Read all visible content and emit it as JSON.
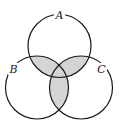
{
  "diagram": {
    "type": "venn",
    "sets": [
      {
        "label": "A",
        "cx": 59.5,
        "cy": 46,
        "r": 31.5
      },
      {
        "label": "B",
        "cx": 37,
        "cy": 87.5,
        "r": 31.5
      },
      {
        "label": "C",
        "cx": 81,
        "cy": 87.5,
        "r": 31.5
      }
    ],
    "shaded_regions": [
      "A∩B",
      "A∩C",
      "B∩C"
    ],
    "colors": {
      "stroke": "#1a1a1a",
      "shade": "#d4d4d4",
      "background": "#ffffff"
    }
  }
}
